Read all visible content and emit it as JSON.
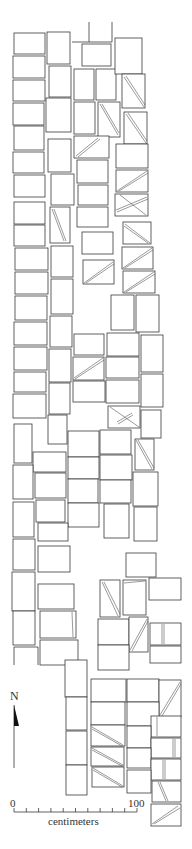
{
  "figure": {
    "type": "archaeological plan",
    "north_label": "N",
    "scale": {
      "start_label": "0",
      "end_label": "100",
      "unit_label": "centimeters",
      "ticks": 11
    }
  },
  "stubs": [
    [
      89,
      22,
      89,
      42
    ],
    [
      112,
      22,
      112,
      42
    ],
    [
      72,
      42,
      89,
      42
    ],
    [
      89,
      42,
      112,
      42
    ]
  ],
  "blocks": [
    {
      "r": [
        14,
        33,
        31,
        21
      ]
    },
    {
      "r": [
        13,
        56,
        32,
        22
      ]
    },
    {
      "r": [
        13,
        80,
        32,
        21
      ]
    },
    {
      "r": [
        13,
        103,
        31,
        22
      ]
    },
    {
      "r": [
        14,
        126,
        30,
        24
      ]
    },
    {
      "r": [
        13,
        152,
        31,
        21
      ]
    },
    {
      "r": [
        14,
        175,
        31,
        22
      ]
    },
    {
      "r": [
        14,
        202,
        31,
        22
      ]
    },
    {
      "r": [
        14,
        225,
        31,
        21
      ]
    },
    {
      "r": [
        15,
        248,
        33,
        22
      ]
    },
    {
      "r": [
        15,
        272,
        33,
        22
      ]
    },
    {
      "r": [
        15,
        296,
        32,
        24
      ]
    },
    {
      "r": [
        14,
        322,
        33,
        23
      ]
    },
    {
      "r": [
        14,
        347,
        33,
        23
      ]
    },
    {
      "r": [
        14,
        372,
        32,
        20
      ]
    },
    {
      "r": [
        13,
        394,
        33,
        24
      ]
    },
    {
      "r": [
        47,
        32,
        23,
        32
      ]
    },
    {
      "r": [
        49,
        66,
        22,
        31
      ]
    },
    {
      "r": [
        46,
        98,
        25,
        34
      ]
    },
    {
      "r": [
        48,
        139,
        23,
        33
      ]
    },
    {
      "r": [
        51,
        174,
        23,
        31
      ]
    },
    {
      "r": [
        50,
        207,
        20,
        36
      ],
      "d": [
        [
          52,
          209,
          64,
          241
        ],
        [
          54,
          209,
          66,
          241
        ]
      ]
    },
    {
      "r": [
        51,
        246,
        22,
        31
      ]
    },
    {
      "r": [
        51,
        279,
        22,
        35
      ]
    },
    {
      "r": [
        50,
        316,
        22,
        31
      ]
    },
    {
      "r": [
        49,
        349,
        22,
        33
      ]
    },
    {
      "r": [
        49,
        383,
        21,
        31
      ]
    },
    {
      "r": [
        82,
        44,
        29,
        22
      ]
    },
    {
      "r": [
        74,
        69,
        20,
        31
      ]
    },
    {
      "r": [
        96,
        69,
        20,
        31
      ]
    },
    {
      "r": [
        74,
        102,
        21,
        32
      ]
    },
    {
      "r": [
        98,
        102,
        22,
        35
      ],
      "d": [
        [
          100,
          104,
          118,
          135
        ],
        [
          102,
          104,
          119,
          133
        ]
      ]
    },
    {
      "r": [
        74,
        136,
        35,
        22
      ],
      "d": [
        [
          76,
          156,
          98,
          138
        ],
        [
          78,
          157,
          100,
          139
        ]
      ]
    },
    {
      "r": [
        77,
        160,
        31,
        23
      ]
    },
    {
      "r": [
        78,
        185,
        30,
        20
      ]
    },
    {
      "r": [
        77,
        207,
        31,
        20
      ]
    },
    {
      "r": [
        115,
        38,
        27,
        36
      ]
    },
    {
      "r": [
        122,
        74,
        23,
        34
      ],
      "d": [
        [
          124,
          77,
          144,
          107
        ],
        [
          126,
          76,
          145,
          105
        ]
      ]
    },
    {
      "r": [
        124,
        112,
        23,
        32
      ],
      "d": [
        [
          126,
          114,
          146,
          143
        ],
        [
          128,
          113,
          147,
          141
        ]
      ]
    },
    {
      "r": [
        116,
        144,
        32,
        24
      ]
    },
    {
      "r": [
        116,
        170,
        32,
        22
      ],
      "d": [
        [
          117,
          191,
          147,
          171
        ],
        [
          119,
          191,
          148,
          173
        ]
      ]
    },
    {
      "r": [
        115,
        194,
        33,
        22
      ],
      "d": [
        [
          120,
          195,
          146,
          215
        ],
        [
          116,
          210,
          147,
          197
        ],
        [
          117,
          212,
          148,
          199
        ]
      ]
    },
    {
      "r": [
        82,
        232,
        31,
        22
      ]
    },
    {
      "r": [
        83,
        260,
        31,
        24
      ],
      "d": [
        [
          84,
          283,
          113,
          262
        ],
        [
          86,
          283,
          114,
          264
        ]
      ]
    },
    {
      "r": [
        123,
        222,
        28,
        22
      ],
      "d": [
        [
          125,
          224,
          150,
          243
        ],
        [
          124,
          226,
          148,
          243
        ]
      ]
    },
    {
      "r": [
        122,
        247,
        31,
        22
      ],
      "d": [
        [
          123,
          268,
          152,
          248
        ],
        [
          125,
          268,
          153,
          250
        ]
      ]
    },
    {
      "r": [
        123,
        271,
        32,
        22
      ],
      "d": [
        [
          124,
          292,
          154,
          272
        ],
        [
          126,
          292,
          155,
          274
        ]
      ]
    },
    {
      "r": [
        111,
        295,
        23,
        35
      ]
    },
    {
      "r": [
        136,
        295,
        23,
        37
      ]
    },
    {
      "r": [
        74,
        334,
        30,
        21
      ]
    },
    {
      "r": [
        107,
        333,
        32,
        23
      ]
    },
    {
      "r": [
        141,
        335,
        22,
        37
      ]
    },
    {
      "r": [
        73,
        357,
        31,
        23
      ],
      "d": [
        [
          74,
          378,
          103,
          358
        ],
        [
          75,
          379,
          104,
          360
        ]
      ]
    },
    {
      "r": [
        106,
        357,
        33,
        21
      ]
    },
    {
      "r": [
        73,
        381,
        32,
        21
      ]
    },
    {
      "r": [
        106,
        380,
        33,
        23
      ]
    },
    {
      "r": [
        141,
        374,
        22,
        33
      ]
    },
    {
      "r": [
        108,
        406,
        32,
        22
      ],
      "d": [
        [
          110,
          407,
          139,
          427
        ],
        [
          117,
          422,
          132,
          413
        ],
        [
          118,
          424,
          133,
          415
        ]
      ]
    },
    {
      "r": [
        141,
        410,
        20,
        28
      ]
    },
    {
      "r": [
        48,
        415,
        19,
        29
      ]
    },
    {
      "r": [
        14,
        424,
        18,
        39
      ]
    },
    {
      "r": [
        33,
        452,
        33,
        20
      ]
    },
    {
      "r": [
        13,
        465,
        20,
        34
      ]
    },
    {
      "r": [
        35,
        473,
        31,
        25
      ]
    },
    {
      "r": [
        68,
        431,
        31,
        26
      ]
    },
    {
      "r": [
        100,
        430,
        31,
        24
      ]
    },
    {
      "r": [
        135,
        439,
        19,
        31
      ],
      "d": [
        [
          136,
          440,
          152,
          469
        ],
        [
          138,
          440,
          154,
          468
        ]
      ]
    },
    {
      "r": [
        68,
        457,
        31,
        22
      ]
    },
    {
      "r": [
        100,
        455,
        32,
        25
      ]
    },
    {
      "r": [
        133,
        472,
        25,
        34
      ]
    },
    {
      "r": [
        68,
        479,
        30,
        24
      ]
    },
    {
      "r": [
        100,
        480,
        31,
        23
      ]
    },
    {
      "r": [
        13,
        502,
        21,
        35
      ]
    },
    {
      "r": [
        36,
        500,
        29,
        22
      ]
    },
    {
      "r": [
        68,
        503,
        31,
        24
      ]
    },
    {
      "r": [
        104,
        504,
        25,
        34
      ]
    },
    {
      "r": [
        134,
        507,
        23,
        34
      ]
    },
    {
      "r": [
        38,
        523,
        30,
        18
      ]
    },
    {
      "r": [
        13,
        539,
        22,
        31
      ]
    },
    {
      "r": [
        38,
        546,
        32,
        26
      ]
    },
    {
      "r": [
        126,
        553,
        30,
        24
      ]
    },
    {
      "r": [
        12,
        572,
        23,
        39
      ]
    },
    {
      "r": [
        38,
        584,
        36,
        25
      ]
    },
    {
      "r": [
        100,
        580,
        20,
        37
      ],
      "d": [
        [
          102,
          582,
          118,
          616
        ],
        [
          104,
          582,
          120,
          614
        ]
      ]
    },
    {
      "r": [
        123,
        580,
        23,
        35
      ],
      "d": [
        [
          124,
          583,
          145,
          581
        ]
      ]
    },
    {
      "r": [
        149,
        578,
        32,
        22
      ]
    },
    {
      "r": [
        13,
        611,
        22,
        34
      ]
    },
    {
      "r": [
        40,
        611,
        36,
        27
      ],
      "d": [
        [
          72,
          612,
          73,
          637
        ]
      ]
    },
    {
      "r": [
        150,
        623,
        31,
        22
      ],
      "d": [
        [
          162,
          624,
          162,
          644
        ],
        [
          164,
          624,
          164,
          644
        ]
      ]
    },
    {
      "r": [
        98,
        619,
        31,
        26
      ]
    },
    {
      "r": [
        129,
        617,
        19,
        35
      ],
      "d": [
        [
          130,
          650,
          147,
          619
        ],
        [
          132,
          651,
          148,
          621
        ]
      ]
    },
    {
      "r": [
        98,
        645,
        31,
        25
      ]
    },
    {
      "r": [
        150,
        646,
        31,
        17
      ]
    },
    {
      "r": [
        14,
        647,
        24,
        18
      ],
      "open": true
    },
    {
      "r": [
        40,
        640,
        38,
        25
      ]
    },
    {
      "r": [
        65,
        660,
        22,
        37
      ]
    },
    {
      "r": [
        66,
        697,
        21,
        33
      ]
    },
    {
      "r": [
        66,
        731,
        21,
        34
      ]
    },
    {
      "r": [
        66,
        765,
        21,
        30
      ]
    },
    {
      "r": [
        91,
        679,
        35,
        23
      ]
    },
    {
      "r": [
        127,
        679,
        32,
        23
      ]
    },
    {
      "r": [
        159,
        680,
        22,
        37
      ],
      "d": [
        [
          160,
          715,
          180,
          682
        ],
        [
          162,
          716,
          181,
          684
        ]
      ]
    },
    {
      "r": [
        91,
        702,
        34,
        23
      ]
    },
    {
      "r": [
        127,
        702,
        32,
        24
      ]
    },
    {
      "r": [
        151,
        716,
        30,
        21
      ],
      "d": [
        [
          157,
          717,
          157,
          736
        ]
      ]
    },
    {
      "r": [
        91,
        725,
        34,
        21
      ],
      "d": [
        [
          92,
          727,
          123,
          745
        ],
        [
          92,
          729,
          122,
          746
        ]
      ]
    },
    {
      "r": [
        127,
        726,
        24,
        22
      ]
    },
    {
      "r": [
        151,
        738,
        30,
        20
      ],
      "d": [
        [
          173,
          739,
          173,
          757
        ],
        [
          175,
          739,
          175,
          757
        ]
      ]
    },
    {
      "r": [
        91,
        747,
        33,
        19
      ],
      "d": [
        [
          92,
          748,
          123,
          765
        ],
        [
          92,
          750,
          122,
          766
        ]
      ]
    },
    {
      "r": [
        127,
        748,
        24,
        20
      ]
    },
    {
      "r": [
        151,
        759,
        30,
        21
      ],
      "d": [
        [
          163,
          760,
          163,
          779
        ],
        [
          165,
          760,
          165,
          779
        ]
      ]
    },
    {
      "r": [
        92,
        767,
        32,
        20
      ],
      "d": [
        [
          93,
          768,
          123,
          786
        ],
        [
          93,
          770,
          122,
          787
        ]
      ]
    },
    {
      "r": [
        127,
        770,
        24,
        23
      ]
    },
    {
      "r": [
        152,
        781,
        29,
        21
      ],
      "d": [
        [
          158,
          782,
          166,
          801
        ],
        [
          160,
          782,
          168,
          801
        ]
      ]
    },
    {
      "r": [
        151,
        804,
        30,
        22
      ],
      "d": [
        [
          152,
          824,
          178,
          806
        ],
        [
          154,
          824,
          180,
          808
        ]
      ]
    }
  ]
}
